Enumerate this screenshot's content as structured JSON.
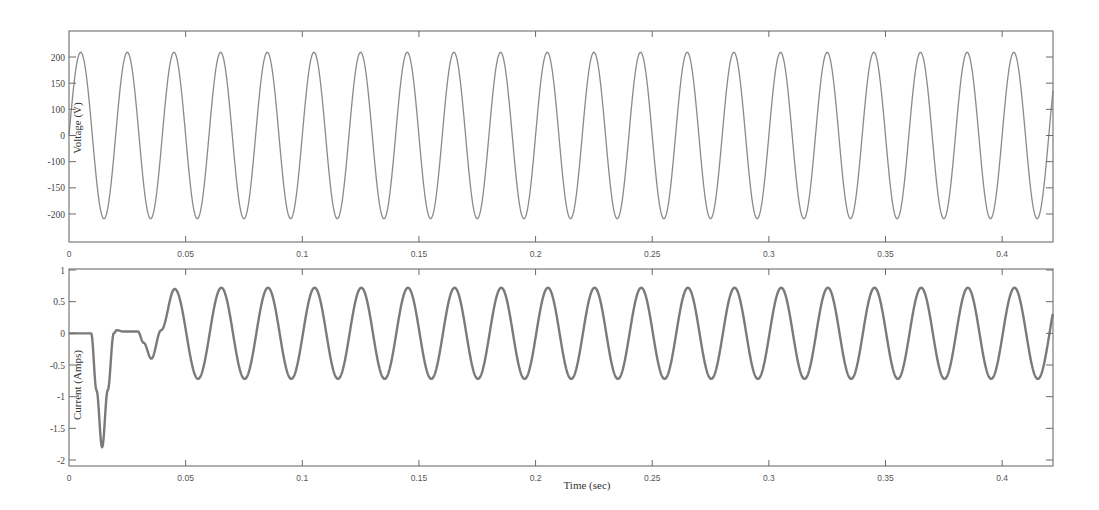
{
  "figure": {
    "width": 1099,
    "height": 510,
    "line_color": "#8a8a8a",
    "current_line_color": "#7a7a7a",
    "frame_color": "#7a7a7a"
  },
  "chart_data": [
    {
      "id": "voltage",
      "type": "line",
      "title": "",
      "xlabel": "",
      "ylabel": "Voltage (V)",
      "xlim": [
        0,
        0.4218
      ],
      "ylim": [
        -250,
        250
      ],
      "grid": false,
      "legend": null,
      "xticks": [
        0,
        0.05,
        0.1,
        0.15,
        0.2,
        0.25,
        0.3,
        0.35,
        0.4
      ],
      "xtick_labels": [
        "0",
        "0.05",
        "0.1",
        "0.15",
        "0.2",
        "0.25",
        "0.3",
        "0.35",
        "0.4"
      ],
      "yticks": [
        200,
        133.3,
        66.7,
        0,
        -66.7,
        -133.3,
        -200
      ],
      "ytick_labels": [
        "200",
        "150",
        "100",
        "0",
        "-100",
        "-150",
        "-200"
      ],
      "series": [
        {
          "name": "Voltage",
          "model": "sine",
          "amplitude": 212,
          "frequency_hz": 50,
          "phase_deg": 0,
          "peaks": {
            "t": [
              0.005,
              0.025,
              0.045,
              0.065,
              0.085,
              0.105,
              0.125,
              0.145,
              0.165,
              0.185,
              0.205,
              0.225,
              0.245,
              0.265,
              0.285,
              0.305,
              0.325,
              0.345,
              0.365,
              0.385,
              0.405
            ],
            "value": 212
          },
          "troughs": {
            "t": [
              0.015,
              0.035,
              0.055,
              0.075,
              0.095,
              0.115,
              0.135,
              0.155,
              0.175,
              0.195,
              0.215,
              0.235,
              0.255,
              0.275,
              0.295,
              0.315,
              0.335,
              0.355,
              0.375,
              0.395,
              0.415
            ],
            "value": -212
          }
        }
      ]
    },
    {
      "id": "current",
      "type": "line",
      "title": "",
      "xlabel": "Time (sec)",
      "ylabel": "Current (Amps)",
      "xlim": [
        0,
        0.4218
      ],
      "ylim": [
        -2.1,
        1.05
      ],
      "grid": false,
      "legend": null,
      "xticks": [
        0,
        0.05,
        0.1,
        0.15,
        0.2,
        0.25,
        0.3,
        0.35,
        0.4
      ],
      "xtick_labels": [
        "0",
        "0.05",
        "0.1",
        "0.15",
        "0.2",
        "0.25",
        "0.3",
        "0.35",
        "0.4"
      ],
      "yticks": [
        1,
        0.5,
        0,
        -0.5,
        -1,
        -1.5,
        -2
      ],
      "ytick_labels": [
        "1",
        "0.5",
        "0",
        "-0.5",
        "-1",
        "-1.5",
        "-2"
      ],
      "series": [
        {
          "name": "Current",
          "transient_points": [
            [
              0,
              0
            ],
            [
              0.0095,
              0
            ],
            [
              0.0118,
              -0.9
            ],
            [
              0.0142,
              -1.8
            ],
            [
              0.0166,
              -0.9
            ],
            [
              0.0192,
              0.0
            ],
            [
              0.0205,
              0.05
            ],
            [
              0.023,
              0.03
            ],
            [
              0.0295,
              0.03
            ],
            [
              0.032,
              -0.15
            ],
            [
              0.0353,
              -0.4
            ],
            [
              0.0395,
              0.05
            ],
            [
              0.0453,
              0.7
            ]
          ],
          "steady_state": {
            "model": "sine",
            "start_t": 0.0453,
            "amplitude": 0.72,
            "offset": 0.0,
            "frequency_hz": 50,
            "first_peak_t": 0.0453
          },
          "peaks": {
            "t": [
              0.0453,
              0.0653,
              0.0853,
              0.1053,
              0.1253,
              0.1453,
              0.1653,
              0.1853,
              0.2053,
              0.2253,
              0.2453,
              0.2653,
              0.2853,
              0.3053,
              0.3253,
              0.3453,
              0.3653,
              0.3853,
              0.4053
            ],
            "value": 0.72
          },
          "troughs": {
            "t": [
              0.0553,
              0.0753,
              0.0953,
              0.1153,
              0.1353,
              0.1553,
              0.1753,
              0.1953,
              0.2153,
              0.2353,
              0.2553,
              0.2753,
              0.2953,
              0.3153,
              0.3353,
              0.3553,
              0.3753,
              0.3953,
              0.4153
            ],
            "value": -0.72
          },
          "min_value": -1.8,
          "min_t": 0.0142
        }
      ]
    }
  ]
}
